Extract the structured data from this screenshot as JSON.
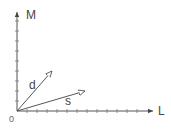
{
  "diagram": {
    "axes": {
      "x_label": "L",
      "y_label": "M",
      "origin_label": "0"
    },
    "vectors": [
      {
        "name": "d",
        "from": [
          0,
          0
        ],
        "to": [
          35,
          40
        ]
      },
      {
        "name": "s",
        "from": [
          0,
          0
        ],
        "to": [
          68,
          20
        ]
      }
    ],
    "colors": {
      "axis": "#555555",
      "vector": "#555555",
      "text": "#444444"
    }
  }
}
